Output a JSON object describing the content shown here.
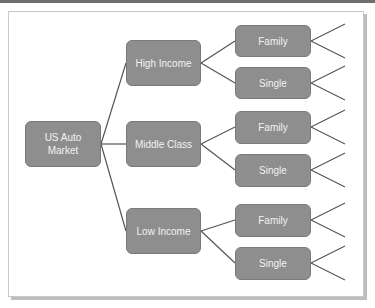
{
  "diagram": {
    "colors": {
      "node_fill": "#8e8e8e",
      "node_border": "#7a7a7a",
      "node_text": "#f2f2f2",
      "line": "#555555"
    },
    "root": {
      "label": "US Auto Market"
    },
    "segments": [
      {
        "label": "High Income",
        "children": [
          {
            "label": "Family"
          },
          {
            "label": "Single"
          }
        ]
      },
      {
        "label": "Middle Class",
        "children": [
          {
            "label": "Family"
          },
          {
            "label": "Single"
          }
        ]
      },
      {
        "label": "Low Income",
        "children": [
          {
            "label": "Family"
          },
          {
            "label": "Single"
          }
        ]
      }
    ]
  }
}
